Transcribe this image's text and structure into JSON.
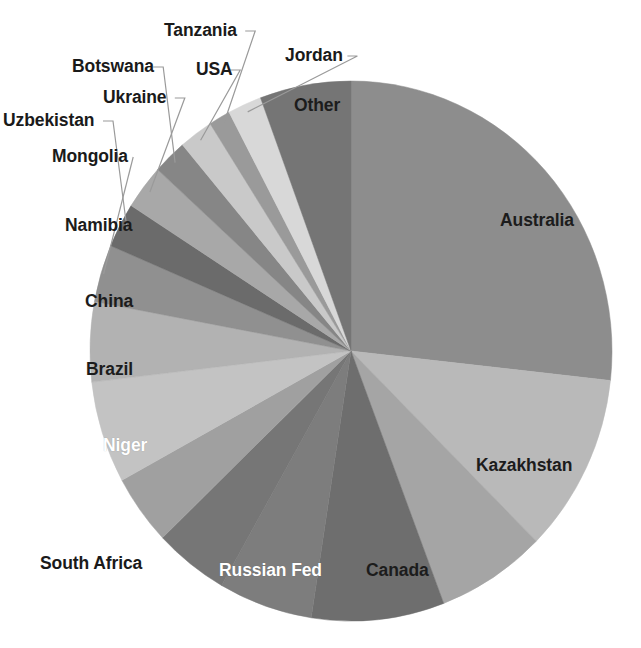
{
  "chart_data": {
    "type": "pie",
    "title": "",
    "subtitle": "",
    "xlabel": "",
    "ylabel": "",
    "legend_position": "none",
    "grid": false,
    "start_angle_deg": 0,
    "direction": "clockwise",
    "center": {
      "x": 351,
      "y": 351
    },
    "radius": {
      "rx": 261,
      "ry": 270
    },
    "labels": [
      "Australia",
      "Kazakhstan",
      "Canada",
      "Russian Fed",
      "Niger",
      "South Africa",
      "Brazil",
      "China",
      "Namibia",
      "Mongolia",
      "Uzbekistan",
      "Ukraine",
      "Botswana",
      "USA",
      "Tanzania",
      "Jordan",
      "Other"
    ],
    "values": [
      28.0,
      11.2,
      7.1,
      8.6,
      6.1,
      4.8,
      4.4,
      6.4,
      5.0,
      3.6,
      2.8,
      2.8,
      2.2,
      2.2,
      1.4,
      2.2,
      5.9
    ],
    "value_unit": "percent",
    "slices": [
      {
        "label": "Australia",
        "value": 28.0,
        "color": "#8d8d8d",
        "label_placement": "inside",
        "label_color": "dark",
        "label_x": 500,
        "label_y": 212
      },
      {
        "label": "Kazakhstan",
        "value": 11.2,
        "color": "#b9b9b9",
        "label_placement": "inside",
        "label_color": "dark",
        "label_x": 476,
        "label_y": 457
      },
      {
        "label": "Canada",
        "value": 7.1,
        "color": "#a5a5a5",
        "label_placement": "inside",
        "label_color": "dark",
        "label_x": 366,
        "label_y": 562
      },
      {
        "label": "Russian Fed",
        "value": 8.6,
        "color": "#6e6e6e",
        "label_placement": "inside",
        "label_color": "light",
        "label_x": 219,
        "label_y": 562
      },
      {
        "label": "Niger",
        "value": 6.1,
        "color": "#7d7d7d",
        "label_placement": "inside",
        "label_color": "light",
        "label_x": 103,
        "label_y": 437
      },
      {
        "label": "South Africa",
        "value": 4.8,
        "color": "#767676",
        "label_placement": "outside",
        "label_color": "dark",
        "label_x": 40,
        "label_y": 555
      },
      {
        "label": "Brazil",
        "value": 4.4,
        "color": "#a0a0a0",
        "label_placement": "inside",
        "label_color": "dark",
        "label_x": 86,
        "label_y": 361
      },
      {
        "label": "China",
        "value": 6.4,
        "color": "#c3c3c3",
        "label_placement": "inside",
        "label_color": "dark",
        "label_x": 85,
        "label_y": 293
      },
      {
        "label": "Namibia",
        "value": 5.0,
        "color": "#b2b2b2",
        "label_placement": "inside",
        "label_color": "dark",
        "label_x": 65,
        "label_y": 217
      },
      {
        "label": "Mongolia",
        "value": 3.6,
        "color": "#909090",
        "label_placement": "outside",
        "label_color": "dark",
        "label_x": 52,
        "label_y": 148
      },
      {
        "label": "Uzbekistan",
        "value": 2.8,
        "color": "#6b6b6b",
        "label_placement": "outside",
        "label_color": "dark",
        "label_x": 3,
        "label_y": 112
      },
      {
        "label": "Ukraine",
        "value": 2.8,
        "color": "#a8a8a8",
        "label_placement": "outside",
        "label_color": "dark",
        "label_x": 103,
        "label_y": 89
      },
      {
        "label": "Botswana",
        "value": 2.2,
        "color": "#868686",
        "label_placement": "outside",
        "label_color": "dark",
        "label_x": 72,
        "label_y": 58
      },
      {
        "label": "USA",
        "value": 2.2,
        "color": "#c9c9c9",
        "label_placement": "outside",
        "label_color": "dark",
        "label_x": 196,
        "label_y": 61
      },
      {
        "label": "Tanzania",
        "value": 1.4,
        "color": "#9a9a9a",
        "label_placement": "outside",
        "label_color": "dark",
        "label_x": 164,
        "label_y": 22
      },
      {
        "label": "Jordan",
        "value": 2.2,
        "color": "#d8d8d8",
        "label_placement": "outside",
        "label_color": "dark",
        "label_x": 285,
        "label_y": 47
      },
      {
        "label": "Other",
        "value": 5.9,
        "color": "#757575",
        "label_placement": "inside",
        "label_color": "dark",
        "label_x": 294,
        "label_y": 97
      }
    ]
  },
  "figure": {
    "background_color": "#ffffff",
    "leader_line_color": "#9a9a9a"
  }
}
